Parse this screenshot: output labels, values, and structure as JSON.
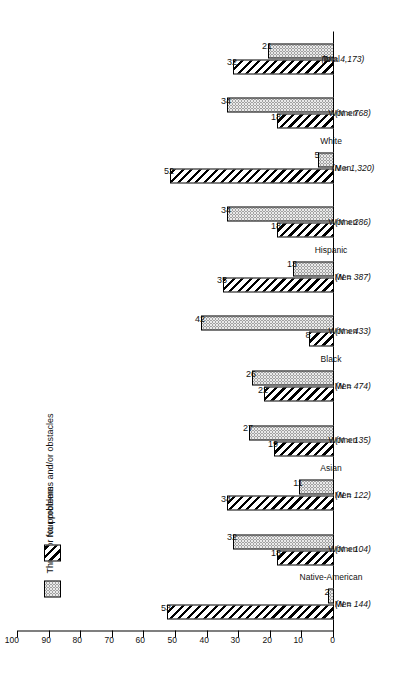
{
  "chart_data": {
    "type": "bar",
    "title": "",
    "xlabel": "",
    "ylabel": "",
    "ylim": [
      0,
      100
    ],
    "grid": false,
    "orientation": "horizontal-rotated",
    "legend_position": "left",
    "tick_labels": [
      "0",
      "10",
      "20",
      "30",
      "40",
      "50",
      "60",
      "70",
      "80",
      "90",
      "100"
    ],
    "tick_values": [
      0,
      10,
      20,
      30,
      40,
      50,
      60,
      70,
      80,
      90,
      100
    ],
    "categories": [
      "Native-American Men",
      "Native-American Women",
      "Asian Men",
      "Asian Women",
      "Black Men",
      "Black Women",
      "Hispanic Men",
      "Hispanic Women",
      "White Men",
      "White Women",
      "Total"
    ],
    "groups": [
      {
        "name": "Native-American",
        "sub": "Men",
        "n": "(N = 144)"
      },
      {
        "name": "",
        "sub": "Women",
        "n": "(N = 104)"
      },
      {
        "name": "Asian",
        "sub": "Men",
        "n": "(N = 122)"
      },
      {
        "name": "",
        "sub": "Women",
        "n": "(N = 135)"
      },
      {
        "name": "Black",
        "sub": "Men",
        "n": "(N = 474)"
      },
      {
        "name": "",
        "sub": "Women",
        "n": "(N = 433)"
      },
      {
        "name": "Hispanic",
        "sub": "Men",
        "n": "(N = 387)"
      },
      {
        "name": "",
        "sub": "Women",
        "n": "(N = 286)"
      },
      {
        "name": "White",
        "sub": "Men",
        "n": "(N = 1,320)"
      },
      {
        "name": "",
        "sub": "Women",
        "n": "(N = 768)"
      },
      {
        "name": "Total",
        "sub": "",
        "n": "(N = 4,173)"
      }
    ],
    "group_headers": [
      {
        "label": "Native-American",
        "span_start": 0,
        "span_end": 1
      },
      {
        "label": "Asian",
        "span_start": 2,
        "span_end": 3
      },
      {
        "label": "Black",
        "span_start": 4,
        "span_end": 5
      },
      {
        "label": "Hispanic",
        "span_start": 6,
        "span_end": 7
      },
      {
        "label": "White",
        "span_start": 8,
        "span_end": 9
      },
      {
        "label": "Total",
        "span_start": 10,
        "span_end": 10
      }
    ],
    "series": [
      {
        "name": "No problems",
        "key": "none",
        "pattern": "diagonal-hatch",
        "values": [
          53,
          18,
          34,
          19,
          22,
          8,
          35,
          18,
          52,
          18,
          32
        ]
      },
      {
        "name": "Three or four problems and/or obstacles",
        "key": "three",
        "pattern": "dotted-stipple",
        "values": [
          2,
          32,
          11,
          27,
          26,
          42,
          13,
          34,
          5,
          34,
          21
        ]
      }
    ]
  },
  "legend": {
    "items": [
      {
        "label": "Three or four problems and/or obstacles",
        "key": "three"
      },
      {
        "label": "No problems",
        "key": "none"
      }
    ]
  },
  "colors": {
    "ink": "#000000",
    "hatch": "#000000",
    "stipple_fill": "#e9e9e9",
    "stipple_dot": "#595959",
    "background": "#ffffff"
  }
}
